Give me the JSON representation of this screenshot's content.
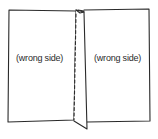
{
  "diagram": {
    "type": "sewing-illustration",
    "labels": {
      "left_panel": "(wrong side)",
      "right_panel": "(wrong side)"
    },
    "colors": {
      "line": "#2a2a2a",
      "fabric": "#ffffff"
    }
  }
}
